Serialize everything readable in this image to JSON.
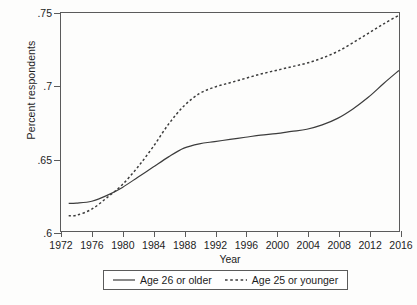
{
  "chart_data": {
    "type": "line",
    "title": "",
    "xlabel": "Year",
    "ylabel": "Percent respondents",
    "xlim": [
      1972,
      2016
    ],
    "ylim": [
      0.6,
      0.75
    ],
    "grid": false,
    "legend_position": "bottom",
    "yticks": [
      0.75,
      0.7,
      0.65,
      0.6
    ],
    "ytick_labels": [
      ".75",
      ".7",
      ".65",
      ".6"
    ],
    "xticks": [
      1972,
      1976,
      1980,
      1984,
      1988,
      1992,
      1996,
      2000,
      2004,
      2008,
      2012,
      2016
    ],
    "xtick_labels": [
      "1972",
      "1976",
      "1980",
      "1984",
      "1988",
      "1992",
      "1996",
      "2000",
      "2004",
      "2008",
      "2012",
      "2016"
    ],
    "series": [
      {
        "name": "Age 26 or older",
        "style": "solid",
        "color": "#3c3c3c",
        "x": [
          1973,
          1974,
          1976,
          1978,
          1980,
          1982,
          1984,
          1986,
          1988,
          1990,
          1992,
          1994,
          1996,
          1998,
          2000,
          2002,
          2004,
          2006,
          2008,
          2010,
          2012,
          2014,
          2016
        ],
        "values": [
          0.619,
          0.6192,
          0.6205,
          0.6245,
          0.63,
          0.637,
          0.644,
          0.651,
          0.657,
          0.66,
          0.6615,
          0.663,
          0.6645,
          0.666,
          0.667,
          0.6685,
          0.67,
          0.673,
          0.6775,
          0.684,
          0.692,
          0.7015,
          0.7105
        ]
      },
      {
        "name": "Age 25 or younger",
        "style": "dashed",
        "color": "#3c3c3c",
        "x": [
          1973,
          1974,
          1976,
          1978,
          1980,
          1982,
          1984,
          1986,
          1988,
          1990,
          1992,
          1994,
          1996,
          1998,
          2000,
          2002,
          2004,
          2006,
          2008,
          2010,
          2012,
          2014,
          2016
        ],
        "values": [
          0.6105,
          0.6108,
          0.615,
          0.623,
          0.632,
          0.644,
          0.658,
          0.6735,
          0.686,
          0.6945,
          0.699,
          0.702,
          0.705,
          0.708,
          0.7105,
          0.713,
          0.7155,
          0.719,
          0.7235,
          0.7295,
          0.736,
          0.7425,
          0.7485
        ]
      }
    ]
  },
  "legend": {
    "entries": [
      {
        "label": "Age 26 or older",
        "style": "solid"
      },
      {
        "label": "Age 25 or younger",
        "style": "dashed"
      }
    ]
  }
}
